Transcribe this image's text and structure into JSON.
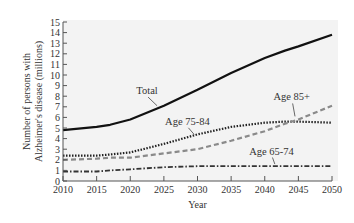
{
  "chart_data": {
    "type": "line",
    "title": "",
    "xlabel": "Year",
    "ylabel": "Number of persons with Alzheimer's disease (millions)",
    "ylabel_lines": [
      "Number of persons with",
      "Alzheimer's disease (millions)"
    ],
    "xlim": [
      2010,
      2050
    ],
    "ylim": [
      0,
      15
    ],
    "x_ticks": [
      2010,
      2015,
      2020,
      2025,
      2030,
      2035,
      2040,
      2045,
      2050
    ],
    "y_ticks": [
      0,
      1,
      2,
      3,
      4,
      5,
      6,
      7,
      8,
      9,
      10,
      11,
      12,
      13,
      14,
      15
    ],
    "grid": false,
    "legend": "inline annotations",
    "x": [
      2010,
      2015,
      2017,
      2020,
      2025,
      2030,
      2035,
      2040,
      2043,
      2045,
      2050
    ],
    "series": [
      {
        "name": "Total",
        "style": "solid",
        "values": [
          4.8,
          5.1,
          5.3,
          5.8,
          7.1,
          8.6,
          10.2,
          11.6,
          12.3,
          12.7,
          13.8
        ]
      },
      {
        "name": "Age 75-84",
        "style": "dotted",
        "values": [
          2.4,
          2.4,
          2.5,
          2.7,
          3.5,
          4.4,
          5.1,
          5.5,
          5.6,
          5.6,
          5.5
        ]
      },
      {
        "name": "Age 85+",
        "style": "dashed",
        "values": [
          2.0,
          2.1,
          2.2,
          2.2,
          2.6,
          3.0,
          3.8,
          4.7,
          5.4,
          5.8,
          7.1
        ]
      },
      {
        "name": "Age 65-74",
        "style": "dash-dot",
        "values": [
          0.9,
          0.9,
          1.0,
          1.1,
          1.3,
          1.4,
          1.4,
          1.4,
          1.4,
          1.4,
          1.4
        ]
      }
    ],
    "annotations": [
      {
        "text": "Total",
        "x": 2022.5,
        "y": 8.2,
        "target_x": 2024,
        "target_y": 7.0
      },
      {
        "text": "Age 75-84",
        "x": 2028.5,
        "y": 5.3,
        "target_x": 2029.5,
        "target_y": 4.3
      },
      {
        "text": "Age 85+",
        "x": 2044,
        "y": 7.6,
        "target_x": 2044.5,
        "target_y": 6.0
      },
      {
        "text": "Age 65-74",
        "x": 2041,
        "y": 2.5,
        "target_x": 2041.5,
        "target_y": 1.5
      }
    ]
  },
  "colors": {
    "plot_bg": "#f3f3f3",
    "axis": "#555555",
    "total": "#111111",
    "age_75_84": "#222222",
    "age_85_plus": "#8a8a8a",
    "age_65_74": "#333333"
  }
}
